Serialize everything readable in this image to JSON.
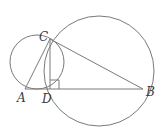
{
  "diagram": {
    "type": "geometry",
    "stroke_color": "#7a7a7a",
    "label_color": "#3a3a3a",
    "points": {
      "A": {
        "label": "A",
        "x": 25,
        "y": 89
      },
      "B": {
        "label": "B",
        "x": 143,
        "y": 89
      },
      "C": {
        "label": "C",
        "x": 50,
        "y": 39
      },
      "D": {
        "label": "D",
        "x": 50,
        "y": 89
      }
    },
    "segments": [
      {
        "from": "A",
        "to": "B"
      },
      {
        "from": "A",
        "to": "C"
      },
      {
        "from": "C",
        "to": "B"
      },
      {
        "from": "C",
        "to": "D"
      }
    ],
    "circles": [
      {
        "name": "small-circle",
        "cx": 37,
        "cy": 62,
        "r": 27
      },
      {
        "name": "large-circle",
        "cx": 99,
        "cy": 71,
        "r": 55
      }
    ],
    "right_angle_mark": {
      "at": "D",
      "size": 9
    }
  }
}
